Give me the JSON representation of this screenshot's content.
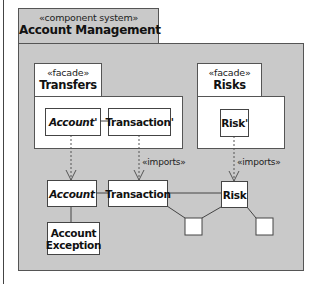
{
  "system": {
    "stereotype": "«component system»",
    "title": "Account Management"
  },
  "facades": [
    {
      "stereotype": "«facade»",
      "title": "Transfers",
      "components": [
        "Account'",
        "Transaction'"
      ]
    },
    {
      "stereotype": "«facade»",
      "title": "Risks",
      "components": [
        "Risk'"
      ]
    }
  ],
  "components": {
    "account": "Account",
    "transaction": "Transaction",
    "risk": "Risk",
    "account_exception": "Account Exception"
  },
  "relations": {
    "imports_1": "«imports»",
    "imports_2": "«imports»"
  },
  "colors": {
    "package_fill": "#c9c9c9",
    "box_fill": "#ffffff",
    "stroke": "#444444"
  }
}
